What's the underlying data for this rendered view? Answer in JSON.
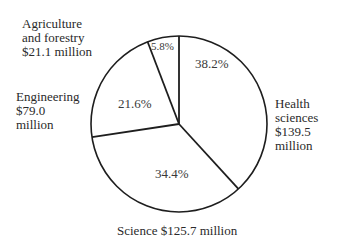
{
  "chart_data": {
    "type": "pie",
    "title": "",
    "categories": [
      "Health sciences",
      "Science",
      "Engineering",
      "Agriculture and forestry"
    ],
    "values": [
      139.5,
      125.7,
      79.0,
      21.1
    ],
    "percentages": [
      38.2,
      34.4,
      21.6,
      5.8
    ],
    "units": "million dollars",
    "legend": "none (direct labels)",
    "slices": [
      {
        "name": "Health sciences",
        "value": 139.5,
        "percent": 38.2,
        "percent_label": "38.2%",
        "label_lines": [
          "Health",
          "sciences",
          "$139.5",
          "million"
        ]
      },
      {
        "name": "Science",
        "value": 125.7,
        "percent": 34.4,
        "percent_label": "34.4%",
        "label_lines": [
          "Science $125.7 million"
        ]
      },
      {
        "name": "Engineering",
        "value": 79.0,
        "percent": 21.6,
        "percent_label": "21.6%",
        "label_lines": [
          "Engineering",
          "$79.0",
          "million"
        ]
      },
      {
        "name": "Agriculture and forestry",
        "value": 21.1,
        "percent": 5.8,
        "percent_label": "5.8%",
        "label_lines": [
          "Agriculture",
          "and forestry",
          "$21.1 million"
        ]
      }
    ]
  }
}
